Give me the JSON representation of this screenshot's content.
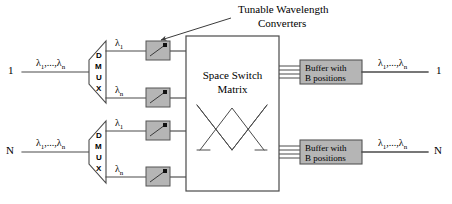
{
  "figure": {
    "kind": "optical-switch-architecture-diagram",
    "annotation_title_line1": "Tunable Wavelength",
    "annotation_title_line2": "Converters"
  },
  "ports": {
    "input_top": "1",
    "input_bottom": "N",
    "output_top": "1",
    "output_bottom": "N"
  },
  "wavelengths": {
    "group_label_prefix": "λ",
    "group_label": "λ",
    "group_sub_first": "1",
    "group_label_mid": ",...,",
    "group_sub_last": "n",
    "single_first": "λ",
    "single_first_sub": "1",
    "single_last": "λ",
    "single_last_sub": "n"
  },
  "dmux": {
    "letters": [
      "D",
      "M",
      "U",
      "X"
    ],
    "count": 2
  },
  "converters": {
    "label": "tunable-wavelength-converter",
    "count": 4,
    "fill": "#b5b5b5",
    "stroke": "#555555"
  },
  "switch_matrix": {
    "line1": "Space Switch",
    "line2": "Matrix"
  },
  "buffers": {
    "line1": "Buffer with",
    "line2": "B positions",
    "count": 2,
    "positions_lines": 4,
    "fill": "#b5b5b5",
    "stroke": "#555555"
  },
  "colors": {
    "background": "#ffffff",
    "line": "#4a4a4a",
    "text": "#000000",
    "box_fill": "#b5b5b5",
    "box_stroke": "#555555",
    "white_fill": "#ffffff"
  }
}
